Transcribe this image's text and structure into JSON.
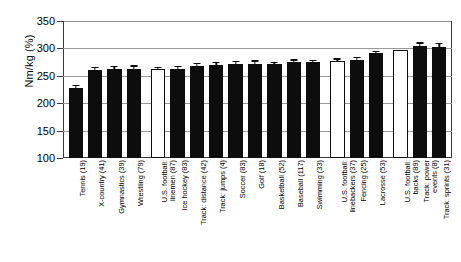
{
  "chart_data": {
    "type": "bar",
    "title": "",
    "xlabel": "",
    "ylabel": "Nm/kg (%)",
    "ylim": [
      100,
      350
    ],
    "yticks": [
      100,
      150,
      200,
      250,
      300,
      350
    ],
    "grid": true,
    "legend": "none",
    "categories": [
      "Tennis (19)",
      "X-country (41)",
      "Gymnastics (39)",
      "Wrestling (79)",
      "U.S. football: linemen (87)",
      "Ice hockey (83)",
      "Track: distance (42)",
      "Track: jumps (4)",
      "Soccer (83)",
      "Golf (18)",
      "Basketball (52)",
      "Baseball (117)",
      "Swimming (33)",
      "U.S. football: linebackers (37)",
      "Fencing (25)",
      "Lacrosse (53)",
      "U.S. football: backs (89)",
      "Track: power events (8)",
      "Track: sprints (31)"
    ],
    "values": [
      227,
      260,
      262,
      262,
      263,
      263,
      267,
      270,
      272,
      272,
      271,
      276,
      275,
      277,
      279,
      291,
      297,
      304,
      303
    ],
    "errors": [
      7,
      6,
      6,
      7,
      3,
      5,
      7,
      6,
      5,
      6,
      5,
      4,
      4,
      5,
      6,
      4,
      0,
      7,
      7
    ],
    "fills": [
      "solid",
      "solid",
      "solid",
      "solid",
      "open",
      "solid",
      "solid",
      "solid",
      "solid",
      "solid",
      "solid",
      "solid",
      "solid",
      "open",
      "solid",
      "solid",
      "open",
      "solid",
      "solid"
    ],
    "colors": {
      "bar_solid": "#0d0d0d",
      "bar_open": "#ffffff",
      "outline": "#0d0d0d",
      "grid": "#9a9a9a",
      "axis": "#3a3a3a"
    },
    "group_breaks_after": [
      4,
      13,
      16
    ]
  },
  "axis_tick_labels": [
    "350",
    "300",
    "250",
    "200",
    "150",
    "100"
  ],
  "category_label_lines": [
    [
      "Tennis (19)"
    ],
    [
      "X-country (41)"
    ],
    [
      "Gymnastics (39)"
    ],
    [
      "Wrestling (79)"
    ],
    [
      "U.S. football:",
      "linemen (87)"
    ],
    [
      "Ice hockey (83)"
    ],
    [
      "Track: distance (42)"
    ],
    [
      "Track: jumps (4)"
    ],
    [
      "Soccer (83)"
    ],
    [
      "Golf (18)"
    ],
    [
      "Basketball (52)"
    ],
    [
      "Baseball (117)"
    ],
    [
      "Swimming (33)"
    ],
    [
      "U.S. football:",
      "linebackers (37)"
    ],
    [
      "Fencing (25)"
    ],
    [
      "Lacrosse (53)"
    ],
    [
      "U.S. football:",
      "backs (89)"
    ],
    [
      "Track: power",
      "events (8)"
    ],
    [
      "Track: sprints (31)"
    ]
  ]
}
